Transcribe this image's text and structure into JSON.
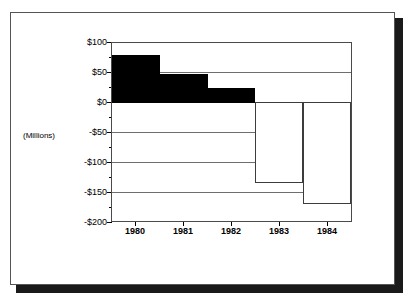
{
  "chart_data": {
    "type": "bar",
    "title": "",
    "subtitle": "",
    "xlabel": "",
    "ylabel": "(Millions)",
    "categories": [
      "1980",
      "1981",
      "1982",
      "1983",
      "1984"
    ],
    "values": [
      80,
      48,
      25,
      -135,
      -170
    ],
    "series": [
      {
        "name": "Net Income",
        "values": [
          80,
          48,
          25,
          -135,
          -170
        ]
      }
    ],
    "ylim": [
      -200,
      100
    ],
    "ytick_labels": [
      "$100",
      "$50",
      "$0",
      "-$50",
      "-$100",
      "-$150",
      "-$200"
    ],
    "ytick_values": [
      100,
      50,
      0,
      -50,
      -100,
      -150,
      -200
    ],
    "grid": true,
    "legend": null,
    "legend_position": "none",
    "bar_style": {
      "positive_fill": "#000000",
      "negative_fill": "#ffffff",
      "outline": "#000000",
      "gap": 0
    },
    "annotations": []
  },
  "figure": {
    "frame_color": "#555555",
    "shadow_color": "#1a1a1a",
    "background": "#ffffff"
  }
}
